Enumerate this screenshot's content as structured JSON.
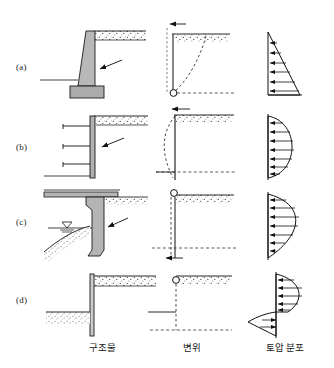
{
  "figure": {
    "row_labels": [
      "(a)",
      "(b)",
      "(c)",
      "(d)"
    ],
    "column_labels": [
      "구조물",
      "변위",
      "토압 분포"
    ],
    "column_labels_meaning": [
      "structure",
      "displacement",
      "earth pressure distribution"
    ],
    "caption": "",
    "colors": {
      "line": "#1a1a1a",
      "concrete_fill": "#b3b3b3",
      "soil_fill": "#ffffff",
      "dashed": "#333333",
      "background": "#ffffff"
    },
    "rows": [
      {
        "id": "a",
        "label": "(a)",
        "structure": {
          "name": "gravity-retaining-wall",
          "parts": [
            "tapered-stem",
            "footing",
            "backfill-ground-line",
            "pressure-arrow"
          ]
        },
        "displacement": {
          "name": "rotation-about-base",
          "pivot": "bottom",
          "pivot_marker": "circle",
          "arrow_direction": "left",
          "arrow_position": "top",
          "deflected_shape": "dashed-curve-bulging-right"
        },
        "pressure": {
          "name": "triangular-distribution",
          "shape": "triangle",
          "max_at": "bottom",
          "arrow_count": 6
        }
      },
      {
        "id": "b",
        "label": "(b)",
        "structure": {
          "name": "braced-excavation-wall",
          "parts": [
            "vertical-wall",
            "strut-1",
            "strut-2",
            "strut-3",
            "excavation-level",
            "pressure-arrow"
          ]
        },
        "displacement": {
          "name": "bulging-deflection",
          "pivot": "top-and-bottom-restrained",
          "arrow_direction": "left",
          "arrow_position": "top",
          "deflected_shape": "dashed-curve-bulging-left"
        },
        "pressure": {
          "name": "parabolic-distribution",
          "shape": "half-ellipse",
          "max_at": "middle",
          "arrow_count": 7
        }
      },
      {
        "id": "c",
        "label": "(c)",
        "structure": {
          "name": "bridge-abutment",
          "parts": [
            "deck-slab",
            "tapered-abutment-stem",
            "footing",
            "water-table-symbol",
            "sloped-ground",
            "pressure-arrow"
          ]
        },
        "displacement": {
          "name": "rotation-about-top",
          "pivot": "top",
          "pivot_marker": "circle",
          "arrow_direction": "left",
          "arrow_position": "bottom",
          "deflected_shape": "dashed-vertical-line"
        },
        "pressure": {
          "name": "bulged-top-distribution",
          "shape": "asymmetric-parabola",
          "max_at": "upper-third",
          "arrow_count": 7
        }
      },
      {
        "id": "d",
        "label": "(d)",
        "structure": {
          "name": "cantilever-sheet-pile-wall",
          "parts": [
            "sheet-pile",
            "retained-backfill",
            "dredge-level-soil",
            "embedded-toe"
          ]
        },
        "displacement": {
          "name": "rotation-about-point-near-base",
          "pivot": "top",
          "pivot_marker": "circle",
          "arrow_direction": "left",
          "arrow_position": "mid-height",
          "deflected_shape": "dashed-vertical-line"
        },
        "pressure": {
          "name": "reversed-double-lobe-distribution",
          "shape": "s-shape",
          "max_at": "upper-and-lower-reversal",
          "arrow_count": 8
        }
      }
    ]
  }
}
